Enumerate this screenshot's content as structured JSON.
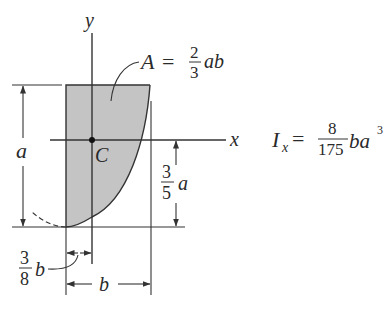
{
  "figure": {
    "type": "parabolic spandrel area diagram",
    "colors": {
      "line": "#333333",
      "fill": "#c4c4c4",
      "background": "#ffffff"
    },
    "axes": {
      "y_label": "y",
      "x_label": "x"
    },
    "centroid_label": "C",
    "area_formula": {
      "lhs": "A",
      "equals": "=",
      "numerator": "2",
      "denominator": "3",
      "suffix": "ab"
    },
    "inertia_formula": {
      "lhs": "I",
      "subscript": "x",
      "equals": "=",
      "numerator": "8",
      "denominator": "175",
      "suffix": "ba",
      "exponent": "3"
    },
    "dimensions": {
      "height": "a",
      "centroid_height": {
        "numerator": "3",
        "denominator": "5",
        "suffix": "a"
      },
      "centroid_offset": {
        "numerator": "3",
        "denominator": "8",
        "suffix": "b"
      },
      "width": "b"
    }
  }
}
